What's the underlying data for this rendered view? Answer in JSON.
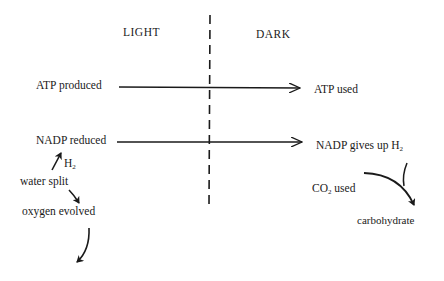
{
  "headers": {
    "light": "LIGHT",
    "dark": "DARK"
  },
  "light_side": {
    "atp": "ATP produced",
    "nadp": "NADP reduced",
    "h2_main": "H",
    "h2_sub": "2",
    "water": "water split",
    "oxygen": "oxygen evolved"
  },
  "dark_side": {
    "atp": "ATP used",
    "nadp_main": "NADP gives up H",
    "nadp_sub": "2",
    "co2_main": "CO",
    "co2_sub": "2",
    "co2_rest": " used",
    "carbohydrate": "carbohydrate"
  },
  "colors": {
    "ink": "#1a1a1a",
    "background": "#ffffff"
  }
}
